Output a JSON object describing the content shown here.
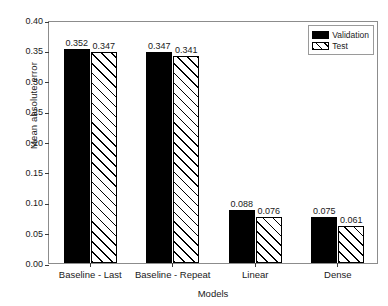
{
  "chart_data": {
    "type": "bar",
    "title": "",
    "xlabel": "Models",
    "ylabel": "Mean absolute error",
    "categories": [
      "Baseline - Last",
      "Baseline - Repeat",
      "Linear",
      "Dense"
    ],
    "series": [
      {
        "name": "Validation",
        "values": [
          0.352,
          0.347,
          0.088,
          0.075
        ],
        "style": "solid-black",
        "color": "#000000"
      },
      {
        "name": "Test",
        "values": [
          0.347,
          0.341,
          0.076,
          0.061
        ],
        "style": "hatched-diagonal",
        "color": "#ffffff"
      }
    ],
    "value_labels": {
      "Validation": [
        "0.352",
        "0.347",
        "0.088",
        "0.075"
      ],
      "Test": [
        "0.347",
        "0.341",
        "0.076",
        "0.061"
      ]
    },
    "ylim": [
      0.0,
      0.4
    ],
    "yticks": [
      "0.00",
      "0.05",
      "0.10",
      "0.15",
      "0.20",
      "0.25",
      "0.30",
      "0.35",
      "0.40"
    ],
    "ytick_values": [
      0.0,
      0.05,
      0.1,
      0.15,
      0.2,
      0.25,
      0.3,
      0.35,
      0.4
    ],
    "grid": false,
    "legend_position": "upper-right",
    "frame_color": "#8c8c8c",
    "text_color": "#1a1a1a"
  },
  "legend": {
    "items": [
      {
        "label": "Validation"
      },
      {
        "label": "Test"
      }
    ]
  },
  "caption": {
    "text": ""
  }
}
